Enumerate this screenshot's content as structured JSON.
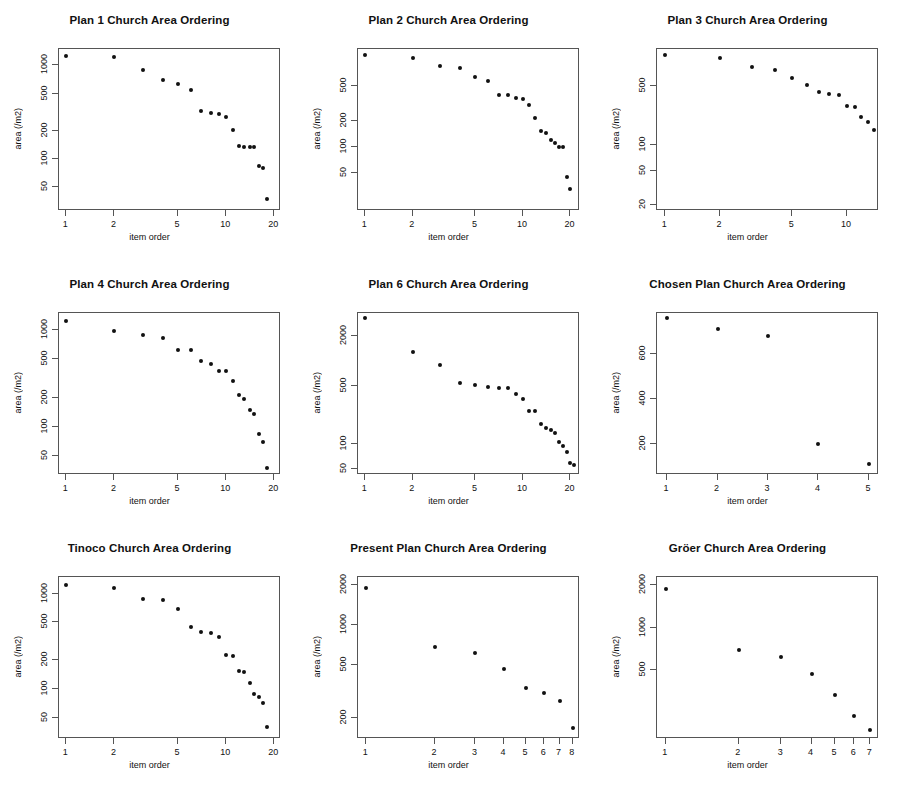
{
  "figure": {
    "width": 897,
    "height": 792,
    "layout": "3x3 grid of log-log scatter panels",
    "background": "#ffffff",
    "point_color": "#111111"
  },
  "common": {
    "xlabel": "item order",
    "ylabel": "area (/m2)"
  },
  "chart_data": [
    {
      "type": "scatter",
      "title": "Plan 1 Church Area Ordering",
      "xlabel": "item order",
      "ylabel": "area (/m2)",
      "xscale": "log",
      "yscale": "log",
      "xticks": [
        1,
        2,
        5,
        10,
        20
      ],
      "yticks": [
        50,
        100,
        200,
        500,
        1000
      ],
      "xlim": [
        0.9,
        22
      ],
      "ylim": [
        28,
        1500
      ],
      "x": [
        1,
        2,
        3,
        4,
        5,
        6,
        7,
        8,
        9,
        10,
        11,
        12,
        13,
        14,
        15,
        16,
        17,
        18
      ],
      "y": [
        1250,
        1230,
        900,
        700,
        640,
        550,
        330,
        310,
        300,
        280,
        205,
        140,
        135,
        135,
        135,
        85,
        80,
        38,
        33
      ]
    },
    {
      "type": "scatter",
      "title": "Plan 2 Church Area Ordering",
      "xlabel": "item order",
      "ylabel": "area (/m2)",
      "xscale": "log",
      "yscale": "log",
      "xticks": [
        1,
        2,
        5,
        10,
        20
      ],
      "yticks": [
        50,
        100,
        200,
        500
      ],
      "xlim": [
        0.9,
        23
      ],
      "ylim": [
        18,
        1350
      ],
      "x": [
        1,
        2,
        3,
        4,
        5,
        6,
        7,
        8,
        9,
        10,
        11,
        12,
        13,
        14,
        15,
        16,
        17,
        18,
        19,
        20
      ],
      "y": [
        1150,
        1050,
        860,
        820,
        640,
        580,
        400,
        400,
        370,
        355,
        300,
        215,
        150,
        145,
        120,
        110,
        100,
        98,
        45,
        32,
        25
      ]
    },
    {
      "type": "scatter",
      "title": "Plan 3 Church Area Ordering",
      "xlabel": "item order",
      "ylabel": "area (/m2)",
      "xscale": "log",
      "yscale": "log",
      "xticks": [
        1,
        2,
        5,
        10
      ],
      "yticks": [
        20,
        50,
        100,
        500
      ],
      "xlim": [
        0.9,
        15
      ],
      "ylim": [
        17,
        1350
      ],
      "x": [
        1,
        2,
        3,
        4,
        5,
        6,
        7,
        8,
        9,
        10,
        11,
        12,
        13,
        14
      ],
      "y": [
        1150,
        1050,
        830,
        760,
        620,
        510,
        420,
        400,
        395,
        290,
        280,
        215,
        190,
        150,
        145,
        120,
        24
      ]
    },
    {
      "type": "scatter",
      "title": "Plan 4 Church Area Ordering",
      "xlabel": "item order",
      "ylabel": "area (/m2)",
      "xscale": "log",
      "yscale": "log",
      "xticks": [
        1,
        2,
        5,
        10,
        20
      ],
      "yticks": [
        50,
        100,
        200,
        500,
        1000
      ],
      "xlim": [
        0.9,
        22
      ],
      "ylim": [
        32,
        1500
      ],
      "x": [
        1,
        2,
        3,
        4,
        5,
        6,
        7,
        8,
        9,
        10,
        11,
        12,
        13,
        14,
        15,
        16,
        17,
        18
      ],
      "y": [
        1250,
        980,
        880,
        830,
        620,
        620,
        480,
        450,
        380,
        380,
        300,
        215,
        195,
        150,
        135,
        85,
        70,
        38
      ]
    },
    {
      "type": "scatter",
      "title": "Plan 6 Church Area Ordering",
      "xlabel": "item order",
      "ylabel": "area (/m2)",
      "xscale": "log",
      "yscale": "log",
      "xticks": [
        1,
        2,
        5,
        10,
        20
      ],
      "yticks": [
        50,
        100,
        500,
        2000
      ],
      "xlim": [
        0.9,
        23
      ],
      "ylim": [
        42,
        3800
      ],
      "x": [
        1,
        2,
        3,
        4,
        5,
        6,
        7,
        8,
        9,
        10,
        11,
        12,
        13,
        14,
        15,
        16,
        17,
        18,
        19,
        20,
        21
      ],
      "y": [
        3300,
        1300,
        900,
        550,
        520,
        480,
        470,
        470,
        400,
        350,
        250,
        250,
        175,
        155,
        145,
        135,
        105,
        95,
        80,
        58,
        55
      ]
    },
    {
      "type": "scatter",
      "title": "Chosen Plan Church Area Ordering",
      "xlabel": "item order",
      "ylabel": "area (/m2)",
      "xscale": "linear",
      "yscale": "linear",
      "xticks": [
        1,
        2,
        3,
        4,
        5
      ],
      "yticks": [
        200,
        400,
        600
      ],
      "xlim": [
        0.8,
        5.2
      ],
      "ylim": [
        60,
        780
      ],
      "x": [
        1,
        2,
        3,
        4,
        5
      ],
      "y": [
        760,
        710,
        680,
        200,
        110
      ]
    },
    {
      "type": "scatter",
      "title": "Tinoco Church Area Ordering",
      "xlabel": "item order",
      "ylabel": "area (/m2)",
      "xscale": "log",
      "yscale": "log",
      "xticks": [
        1,
        2,
        5,
        10,
        20
      ],
      "yticks": [
        50,
        100,
        200,
        500,
        1000
      ],
      "xlim": [
        0.9,
        22
      ],
      "ylim": [
        30,
        1500
      ],
      "x": [
        1,
        2,
        3,
        4,
        5,
        6,
        7,
        8,
        9,
        10,
        11,
        12,
        13,
        14,
        15,
        16,
        17,
        18
      ],
      "y": [
        1250,
        1150,
        880,
        870,
        700,
        450,
        400,
        390,
        355,
        230,
        220,
        155,
        150,
        115,
        90,
        82,
        72,
        40
      ]
    },
    {
      "type": "scatter",
      "title": "Present Plan Church Area Ordering",
      "xlabel": "item order",
      "ylabel": "area (/m2)",
      "xscale": "log",
      "yscale": "log",
      "xticks": [
        1,
        2,
        3,
        4,
        5,
        6,
        7,
        8
      ],
      "yticks": [
        200,
        500,
        1000,
        2000
      ],
      "xlim": [
        0.92,
        8.6
      ],
      "ylim": [
        140,
        2300
      ],
      "x": [
        1,
        2,
        3,
        4,
        5,
        6,
        7,
        8
      ],
      "y": [
        1900,
        690,
        620,
        470,
        340,
        310,
        270,
        170
      ]
    },
    {
      "type": "scatter",
      "title": "Gröer Church Area Ordering",
      "xlabel": "item order",
      "ylabel": "area (/m2)",
      "xscale": "log",
      "yscale": "log",
      "xticks": [
        1,
        2,
        3,
        4,
        5,
        6,
        7
      ],
      "yticks": [
        500,
        1000,
        2000
      ],
      "xlim": [
        0.92,
        7.6
      ],
      "ylim": [
        160,
        2300
      ],
      "x": [
        1,
        2,
        3,
        4,
        5,
        6,
        7
      ],
      "y": [
        1900,
        690,
        620,
        470,
        330,
        235,
        185
      ]
    }
  ]
}
